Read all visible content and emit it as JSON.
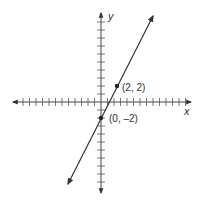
{
  "chart_data": {
    "type": "line",
    "title": "",
    "xlabel": "x",
    "ylabel": "y",
    "grid": false,
    "xlim": [
      -13,
      13
    ],
    "ylim": [
      -11,
      11
    ],
    "line": {
      "slope": 2,
      "intercept": -2,
      "equation": "y = 2x - 2"
    },
    "points": [
      {
        "x": 2,
        "y": 2,
        "label": "(2, 2)"
      },
      {
        "x": 0,
        "y": -2,
        "label": "(0, –2)"
      }
    ]
  },
  "labels": {
    "x_axis": "x",
    "y_axis": "y",
    "point_a": "(2, 2)",
    "point_b": "(0, –2)"
  },
  "colors": {
    "axis": "#444444",
    "line": "#333333",
    "point": "#222222"
  }
}
